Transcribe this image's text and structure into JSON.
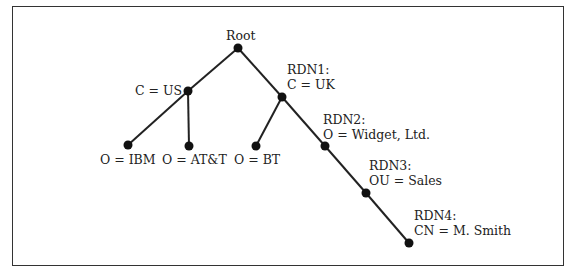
{
  "diagram": {
    "type": "tree",
    "nodes": [
      {
        "id": "root",
        "label": [
          "Root"
        ],
        "x": 238,
        "y": 48,
        "lx": 226,
        "ly": 28
      },
      {
        "id": "us",
        "label": [
          "C = US"
        ],
        "x": 188,
        "y": 91,
        "lx": 135,
        "ly": 83
      },
      {
        "id": "uk",
        "label": [
          "RDN1:",
          "C = UK"
        ],
        "x": 282,
        "y": 97,
        "lx": 287,
        "ly": 62
      },
      {
        "id": "ibm",
        "label": [
          "O = IBM"
        ],
        "x": 128,
        "y": 145,
        "lx": 100,
        "ly": 152
      },
      {
        "id": "att",
        "label": [
          "O = AT&T"
        ],
        "x": 189,
        "y": 146,
        "lx": 162,
        "ly": 152
      },
      {
        "id": "bt",
        "label": [
          "O = BT"
        ],
        "x": 256,
        "y": 146,
        "lx": 234,
        "ly": 152
      },
      {
        "id": "widget",
        "label": [
          "RDN2:",
          "O = Widget, Ltd."
        ],
        "x": 325,
        "y": 146,
        "lx": 323,
        "ly": 112
      },
      {
        "id": "sales",
        "label": [
          "RDN3:",
          "OU = Sales"
        ],
        "x": 366,
        "y": 193,
        "lx": 369,
        "ly": 158
      },
      {
        "id": "smith",
        "label": [
          "RDN4:",
          "CN = M. Smith"
        ],
        "x": 409,
        "y": 243,
        "lx": 414,
        "ly": 208
      }
    ],
    "edges": [
      [
        "root",
        "us"
      ],
      [
        "root",
        "uk"
      ],
      [
        "us",
        "ibm"
      ],
      [
        "us",
        "att"
      ],
      [
        "uk",
        "bt"
      ],
      [
        "uk",
        "widget"
      ],
      [
        "widget",
        "sales"
      ],
      [
        "sales",
        "smith"
      ]
    ]
  }
}
